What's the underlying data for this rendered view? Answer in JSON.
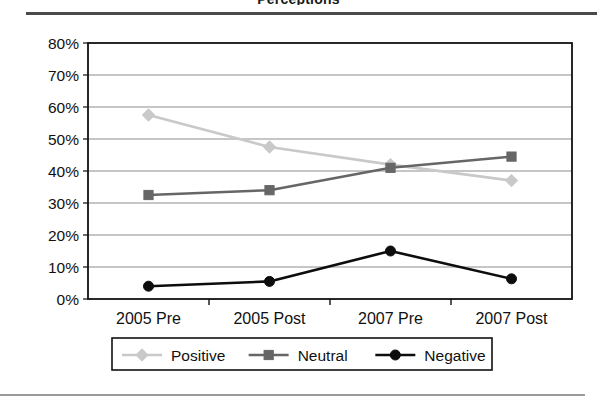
{
  "figure": {
    "title_fragment": "Perceptions",
    "top_rule_color": "#4a4a4a",
    "bottom_rule_color": "#9a9a9a",
    "background": "#ffffff"
  },
  "chart_data": {
    "type": "line",
    "title": "",
    "xlabel": "",
    "ylabel": "",
    "categories": [
      "2005 Pre",
      "2005 Post",
      "2007 Pre",
      "2007 Post"
    ],
    "ylim": [
      0,
      80
    ],
    "ytick_labels": [
      "0%",
      "10%",
      "20%",
      "30%",
      "40%",
      "50%",
      "60%",
      "70%",
      "80%"
    ],
    "ytick_values": [
      0,
      10,
      20,
      30,
      40,
      50,
      60,
      70,
      80
    ],
    "grid": "horizontal",
    "legend_position": "bottom",
    "series": [
      {
        "name": "Positive",
        "values": [
          57.5,
          47.5,
          42,
          37
        ],
        "color": "#c9c9c9",
        "marker": "diamond"
      },
      {
        "name": "Neutral",
        "values": [
          32.5,
          34,
          41,
          44.5
        ],
        "color": "#666666",
        "marker": "square"
      },
      {
        "name": "Negative",
        "values": [
          4,
          5.5,
          15,
          6.3
        ],
        "color": "#0d0d0d",
        "marker": "circle"
      }
    ]
  }
}
